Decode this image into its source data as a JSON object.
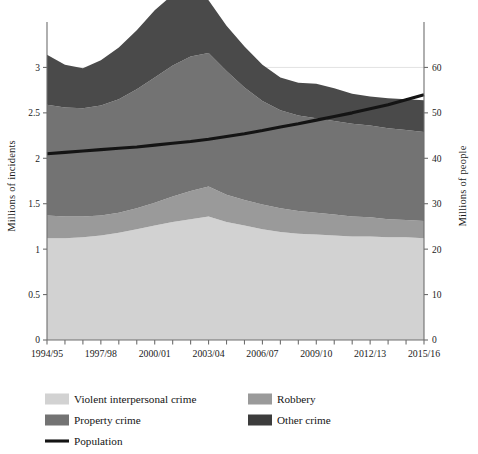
{
  "chart_data": {
    "type": "area",
    "title": "",
    "subtitle": "",
    "xlabel": "",
    "ylabel": "Millions of incidents",
    "y2label": "Millions of people",
    "grid": true,
    "legend_position": "bottom",
    "x": [
      "1994/95",
      "1995/96",
      "1996/97",
      "1997/98",
      "1998/99",
      "1999/00",
      "2000/01",
      "2001/02",
      "2002/03",
      "2003/04",
      "2004/05",
      "2005/06",
      "2006/07",
      "2007/08",
      "2008/09",
      "2009/10",
      "2010/11",
      "2011/12",
      "2012/13",
      "2013/14",
      "2014/15",
      "2015/16"
    ],
    "xtick_labels": [
      "1994/95",
      "1997/98",
      "2000/01",
      "2003/04",
      "2006/07",
      "2009/10",
      "2012/13",
      "2015/16"
    ],
    "xtick_indices": [
      0,
      3,
      6,
      9,
      12,
      15,
      18,
      21
    ],
    "ytick_labels": [
      "0",
      "0.5",
      "1",
      "1.5",
      "2",
      "2.5",
      "3"
    ],
    "ytick_values": [
      0,
      0.5,
      1,
      1.5,
      2,
      2.5,
      3
    ],
    "ylim": [
      0,
      3.5
    ],
    "y2tick_labels": [
      "0",
      "10",
      "20",
      "30",
      "40",
      "50",
      "60"
    ],
    "y2tick_values": [
      0,
      10,
      20,
      30,
      40,
      50,
      60
    ],
    "y2lim": [
      0,
      70
    ],
    "stacked": true,
    "series": [
      {
        "name": "Violent interpersonal crime",
        "color": "#d2d2d2",
        "axis": "left",
        "values": [
          1.12,
          1.12,
          1.13,
          1.15,
          1.18,
          1.22,
          1.26,
          1.3,
          1.33,
          1.36,
          1.3,
          1.26,
          1.22,
          1.19,
          1.17,
          1.16,
          1.15,
          1.14,
          1.14,
          1.13,
          1.13,
          1.12
        ]
      },
      {
        "name": "Robbery",
        "color": "#9a9a9a",
        "axis": "left",
        "values": [
          0.25,
          0.24,
          0.23,
          0.22,
          0.22,
          0.23,
          0.25,
          0.28,
          0.31,
          0.33,
          0.3,
          0.28,
          0.27,
          0.26,
          0.25,
          0.24,
          0.23,
          0.22,
          0.21,
          0.2,
          0.19,
          0.19
        ]
      },
      {
        "name": "Property crime",
        "color": "#737373",
        "axis": "left",
        "values": [
          1.22,
          1.2,
          1.19,
          1.21,
          1.25,
          1.31,
          1.38,
          1.44,
          1.48,
          1.47,
          1.36,
          1.24,
          1.14,
          1.08,
          1.05,
          1.04,
          1.03,
          1.02,
          1.01,
          1.0,
          0.99,
          0.98
        ]
      },
      {
        "name": "Other crime",
        "color": "#4a4a4a",
        "axis": "left",
        "values": [
          0.55,
          0.47,
          0.44,
          0.5,
          0.57,
          0.65,
          0.74,
          0.78,
          0.72,
          0.58,
          0.5,
          0.45,
          0.4,
          0.36,
          0.36,
          0.38,
          0.36,
          0.33,
          0.32,
          0.33,
          0.34,
          0.35
        ]
      }
    ],
    "line_series": {
      "name": "Population",
      "color": "#141414",
      "axis": "right",
      "values": [
        41.0,
        41.3,
        41.6,
        41.9,
        42.2,
        42.5,
        42.9,
        43.3,
        43.7,
        44.2,
        44.8,
        45.4,
        46.1,
        46.9,
        47.6,
        48.4,
        49.2,
        50.0,
        50.9,
        51.8,
        52.9,
        54.0
      ]
    },
    "legend": [
      {
        "label": "Violent interpersonal crime",
        "color": "#d2d2d2",
        "marker": "swatch"
      },
      {
        "label": "Robbery",
        "color": "#9a9a9a",
        "marker": "swatch"
      },
      {
        "label": "Property crime",
        "color": "#737373",
        "marker": "swatch"
      },
      {
        "label": "Other crime",
        "color": "#3c3c3c",
        "marker": "swatch"
      },
      {
        "label": "Population",
        "color": "#141414",
        "marker": "line"
      }
    ]
  }
}
